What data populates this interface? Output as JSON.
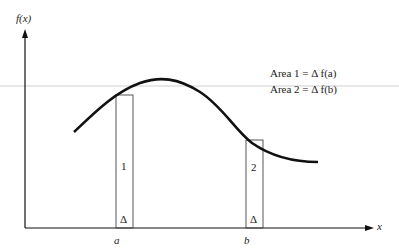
{
  "diagram": {
    "y_axis_label": "f(x)",
    "x_axis_label": "x",
    "point_a": "a",
    "point_b": "b",
    "rect1_label": "1",
    "rect2_label": "2",
    "delta1": "Δ",
    "delta2": "Δ",
    "legend": [
      {
        "text": "Area 1  =  Δ f(a)"
      },
      {
        "text": "Area 2  =  Δ f(b)"
      }
    ],
    "colors": {
      "stroke": "#111111",
      "thin": "#444444",
      "guide": "#cccccc"
    }
  }
}
